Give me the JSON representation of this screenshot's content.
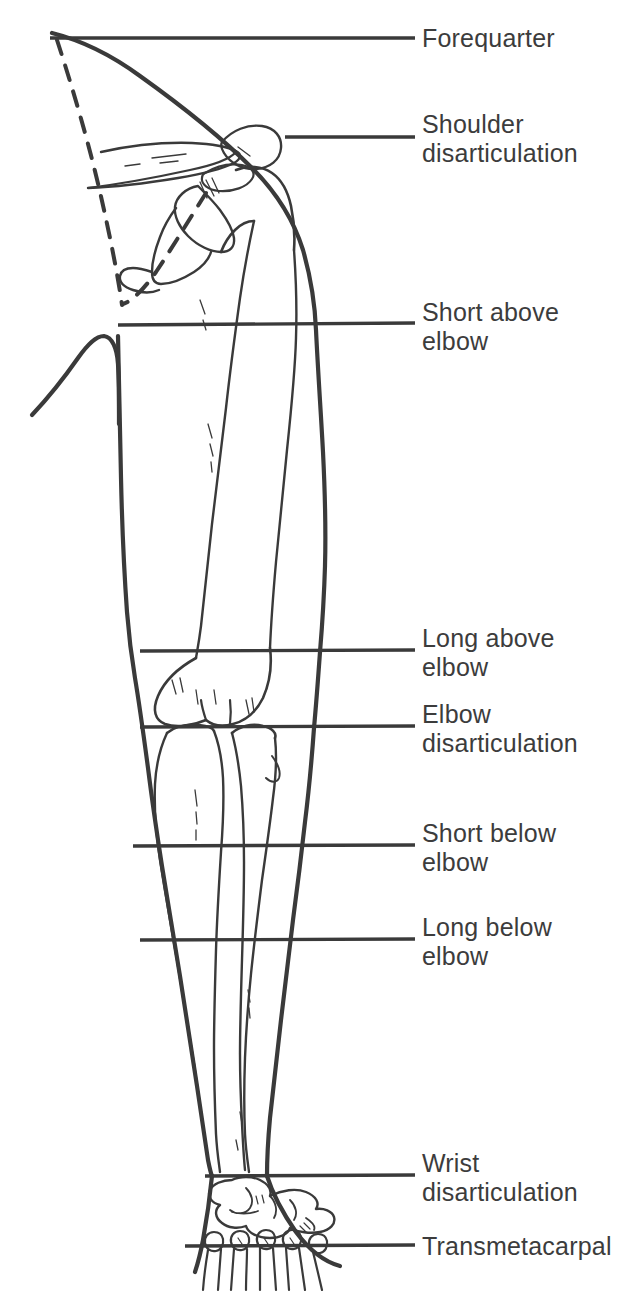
{
  "figure": {
    "ink_color": "#3a3a3a",
    "label_color": "#3c3c3c",
    "background_color": "#ffffff",
    "line_style_note": "solid transverse section lines with dashed forequarter outline"
  },
  "labels": [
    {
      "id": "forequarter",
      "text": "Forequarter",
      "line_y": 38,
      "line_x_start": 50,
      "line_x_end": 415,
      "text_x": 422,
      "text_y": 24
    },
    {
      "id": "shoulder-disarticulation",
      "text": "Shoulder\ndisarticulation",
      "line_y": 137,
      "line_x_start": 285,
      "line_x_end": 415,
      "text_x": 422,
      "text_y": 110
    },
    {
      "id": "short-above-elbow",
      "text": "Short above\nelbow",
      "line_y": 325,
      "line_x_start": 118,
      "line_x_end": 415,
      "text_x": 422,
      "text_y": 298
    },
    {
      "id": "long-above-elbow",
      "text": "Long above\nelbow",
      "line_y": 651,
      "line_x_start": 140,
      "line_x_end": 415,
      "text_x": 422,
      "text_y": 624
    },
    {
      "id": "elbow-disarticulation",
      "text": "Elbow\ndisarticulation",
      "line_y": 727,
      "line_x_start": 140,
      "line_x_end": 415,
      "text_x": 422,
      "text_y": 700
    },
    {
      "id": "short-below-elbow",
      "text": "Short below\nelbow",
      "line_y": 846,
      "line_x_start": 133,
      "line_x_end": 415,
      "text_x": 422,
      "text_y": 819
    },
    {
      "id": "long-below-elbow",
      "text": "Long below\nelbow",
      "line_y": 940,
      "line_x_start": 140,
      "line_x_end": 415,
      "text_x": 422,
      "text_y": 913
    },
    {
      "id": "wrist-disarticulation",
      "text": "Wrist\ndisarticulation",
      "line_y": 1176,
      "line_x_start": 205,
      "line_x_end": 415,
      "text_x": 422,
      "text_y": 1149
    },
    {
      "id": "transmetacarpal",
      "text": "Transmetacarpal",
      "line_y": 1246,
      "line_x_start": 185,
      "line_x_end": 415,
      "text_x": 422,
      "text_y": 1232
    }
  ],
  "anatomy_parts": [
    "shoulder-girdle-outline",
    "clavicle",
    "scapula",
    "humerus",
    "elbow-condyles",
    "radius",
    "ulna",
    "carpal-bones",
    "metacarpals",
    "forequarter-dashed-line",
    "scapula-dashed-line"
  ]
}
